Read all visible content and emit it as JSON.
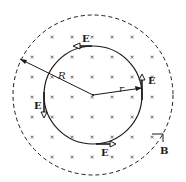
{
  "diagram": {
    "type": "magnetic-field-induced-electric-field",
    "field_marker": "×",
    "labels": {
      "outer_radius": "R",
      "inner_radius": "r",
      "electric_field": "E",
      "magnetic_field": "B"
    },
    "e_labels": [
      "E",
      "E",
      "E",
      "E"
    ],
    "colors": {
      "ink": "#1a1a1a",
      "background": "#ffffff"
    }
  }
}
